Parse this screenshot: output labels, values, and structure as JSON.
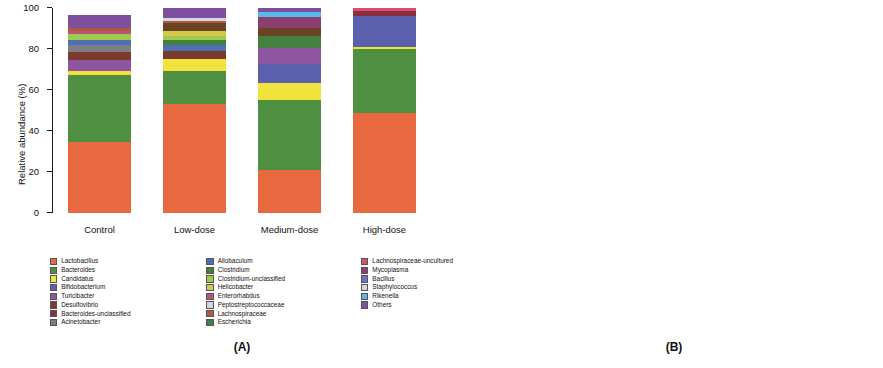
{
  "figure": {
    "panels": [
      {
        "id": "A",
        "caption": "(A)",
        "y_axis_title": "Relative abundance (%)",
        "y_ticks": [
          "0",
          "20",
          "40",
          "60",
          "80",
          "100"
        ]
      },
      {
        "id": "B",
        "caption": "(B)",
        "y_axis_title": "Relative abundance (%)",
        "y_ticks": [
          "0",
          "20",
          "40",
          "60",
          "80",
          "100"
        ]
      }
    ]
  },
  "chart_data": [
    {
      "type": "bar",
      "panel": "A",
      "stacked": true,
      "title": "(A)",
      "xlabel": "",
      "ylabel": "Relative abundance (%)",
      "ylim": [
        0,
        100
      ],
      "grid": false,
      "legend_position": "below",
      "categories": [
        "Control",
        "Low-dose",
        "Medium-dose",
        "High-dose"
      ],
      "series": [
        {
          "name": "Lactobacillus",
          "color": "#e8683f",
          "values": [
            34.5,
            53.0,
            21.0,
            49.0
          ]
        },
        {
          "name": "Bacteroides",
          "color": "#4e8f41",
          "values": [
            33.0,
            16.5,
            34.0,
            31.5
          ]
        },
        {
          "name": "Candidatus",
          "color": "#f2e33c",
          "values": [
            2.0,
            5.5,
            8.5,
            1.0
          ]
        },
        {
          "name": "Bifidobacterium",
          "color": "#5a5fae",
          "values": [
            0.0,
            0.0,
            9.0,
            15.0
          ]
        },
        {
          "name": "Turicibacter",
          "color": "#8e56a0",
          "values": [
            5.0,
            0.0,
            8.0,
            0.0
          ]
        },
        {
          "name": "Desulfovibrio",
          "color": "#7b3a2c",
          "values": [
            4.0,
            4.0,
            0.0,
            0.0
          ]
        },
        {
          "name": "Bacteroides-unclassified",
          "color": "#8a2f3e",
          "values": [
            0.0,
            0.0,
            0.0,
            2.5
          ]
        },
        {
          "name": "Acinetobacter",
          "color": "#7a7f85",
          "values": [
            3.5,
            0.0,
            0.0,
            0.0
          ]
        },
        {
          "name": "Allobaculum",
          "color": "#4f6fb5",
          "values": [
            2.5,
            3.0,
            0.0,
            0.0
          ]
        },
        {
          "name": "Clostridium",
          "color": "#46803e",
          "values": [
            0.0,
            2.5,
            6.0,
            0.0
          ]
        },
        {
          "name": "Clostridium-unclassified",
          "color": "#9ecb4e",
          "values": [
            3.0,
            2.0,
            0.0,
            0.0
          ]
        },
        {
          "name": "Helicobacter",
          "color": "#d5c84a",
          "values": [
            0.0,
            2.5,
            0.0,
            0.0
          ]
        },
        {
          "name": "Enterorhabdus",
          "color": "#b9527e",
          "values": [
            1.5,
            0.0,
            0.0,
            0.0
          ]
        },
        {
          "name": "Peptostreptococcaceae",
          "color": "#6b4226",
          "values": [
            0.0,
            3.5,
            4.0,
            0.0
          ]
        },
        {
          "name": "Lachnospiraceae",
          "color": "#b05a3a",
          "values": [
            1.5,
            1.0,
            0.0,
            0.0
          ]
        },
        {
          "name": "Escherichia",
          "color": "#3f7d52",
          "values": [
            0.0,
            0.0,
            0.0,
            0.0
          ]
        },
        {
          "name": "Lachnospiraceae-uncultured",
          "color": "#d94f6b",
          "values": [
            0.0,
            0.0,
            0.0,
            1.5
          ]
        },
        {
          "name": "Mycoplasma",
          "color": "#8c3f6e",
          "values": [
            0.0,
            0.0,
            5.0,
            0.0
          ]
        },
        {
          "name": "Bacillus",
          "color": "#6f72c8",
          "values": [
            0.0,
            0.0,
            0.0,
            0.0
          ]
        },
        {
          "name": "Staphylococcus",
          "color": "#cfd8e4",
          "values": [
            0.0,
            1.5,
            0.0,
            0.0
          ]
        },
        {
          "name": "Rikenella",
          "color": "#5ab9e8",
          "values": [
            0.0,
            0.0,
            2.5,
            0.0
          ]
        },
        {
          "name": "Others",
          "color": "#7d4f9e",
          "values": [
            6.0,
            5.0,
            2.0,
            0.0
          ]
        }
      ]
    },
    {
      "type": "bar",
      "panel": "B",
      "stacked": true,
      "title": "(B)",
      "xlabel": "",
      "ylabel": "Relative abundance (%)",
      "ylim": [
        0,
        100
      ],
      "grid": false,
      "legend_position": "below",
      "categories": [
        "Control",
        "Low-dose",
        "Medium-dose",
        "High-dose"
      ],
      "series": [
        {
          "name": "Firmicutes",
          "color": "#e8683f",
          "values": [
            44.8,
            69.3,
            55.3,
            51.5
          ]
        },
        {
          "name": "Bacteroidetes",
          "color": "#4e8f41",
          "values": [
            36.8,
            17.5,
            35.5,
            33.0
          ]
        },
        {
          "name": "Proteobacteria",
          "color": "#f2e33c",
          "values": [
            12.0,
            9.5,
            1.2,
            3.5
          ]
        },
        {
          "name": "Actinobacteria",
          "color": "#4f6fb5",
          "values": [
            0.8,
            0.6,
            0.4,
            0.6
          ]
        },
        {
          "name": "Tenericutes",
          "color": "#6f72c8",
          "values": [
            4.6,
            2.8,
            7.3,
            11.4
          ]
        },
        {
          "name": "Others",
          "color": "#8a2f3e",
          "values": [
            1.0,
            0.3,
            0.3,
            0.0
          ]
        }
      ]
    }
  ],
  "legend_a": {
    "columns": [
      [
        {
          "label": "Lactobacillus",
          "color": "#e8683f"
        },
        {
          "label": "Bacteroides",
          "color": "#4e8f41"
        },
        {
          "label": "Candidatus",
          "color": "#f2e33c"
        },
        {
          "label": "Bifidobacterium",
          "color": "#5a5fae"
        },
        {
          "label": "Turicibacter",
          "color": "#8e56a0"
        },
        {
          "label": "Desulfovibrio",
          "color": "#7b3a2c"
        },
        {
          "label": "Bacteroides-unclassified",
          "color": "#8a2f3e"
        },
        {
          "label": "Acinetobacter",
          "color": "#7a7f85"
        }
      ],
      [
        {
          "label": "Allobaculum",
          "color": "#4f6fb5"
        },
        {
          "label": "Clostridium",
          "color": "#46803e"
        },
        {
          "label": "Clostridium-unclassified",
          "color": "#9ecb4e"
        },
        {
          "label": "Helicobacter",
          "color": "#d5c84a"
        },
        {
          "label": "Enterorhabdus",
          "color": "#b9527e"
        },
        {
          "label": "Peptostreptococcaceae",
          "color": "#cfd8e4"
        },
        {
          "label": "Lachnospiraceae",
          "color": "#b05a3a"
        },
        {
          "label": "Escherichia",
          "color": "#3f7d52"
        }
      ],
      [
        {
          "label": "Lachnospiraceae-uncultured",
          "color": "#d94f6b"
        },
        {
          "label": "Mycoplasma",
          "color": "#8c3f6e"
        },
        {
          "label": "Bacillus",
          "color": "#6f72c8"
        },
        {
          "label": "Staphylococcus",
          "color": "#cfd8e4"
        },
        {
          "label": "Rikenella",
          "color": "#5ab9e8"
        },
        {
          "label": "Others",
          "color": "#7d4f9e"
        }
      ]
    ]
  },
  "legend_b": {
    "columns": [
      [
        {
          "label": "Firmicutes",
          "color": "#e8683f"
        },
        {
          "label": "Bacteroidetes",
          "color": "#4e8f41"
        }
      ],
      [
        {
          "label": "Proteobacteria",
          "color": "#f2e33c"
        },
        {
          "label": "Actinobacteria",
          "color": "#4f6fb5"
        }
      ],
      [
        {
          "label": "Tenericutes",
          "color": "#6f72c8"
        },
        {
          "label": "Others",
          "color": "#8a2f3e"
        }
      ]
    ]
  }
}
